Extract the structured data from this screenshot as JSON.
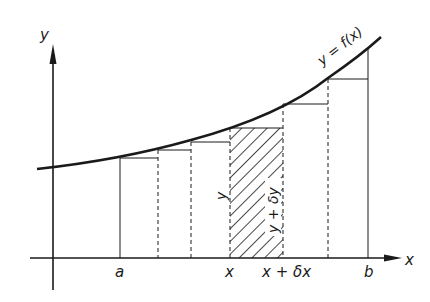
{
  "diagram": {
    "curve_label": "y = f(x)",
    "axes": {
      "x_label": "x",
      "y_label": "y"
    },
    "x_ticks": [
      {
        "label": "a",
        "x": 120
      },
      {
        "label": "x",
        "x": 230
      },
      {
        "label": "x + δx",
        "x": 283
      },
      {
        "label": "b",
        "x": 368
      }
    ],
    "strip_labels": {
      "left_height": "y",
      "right_height": "y + δy"
    },
    "colors": {
      "ink": "#1a1a1a",
      "background": "#ffffff"
    }
  }
}
